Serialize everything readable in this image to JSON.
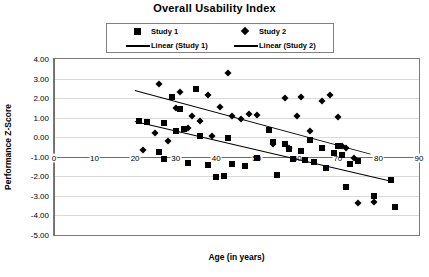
{
  "chart_data": {
    "type": "scatter",
    "title": "Overall Usability Index",
    "xlabel": "Age (in years)",
    "ylabel": "Performance Z-Score",
    "xlim": [
      0,
      90
    ],
    "ylim": [
      -5.0,
      4.0
    ],
    "xticks": [
      "0",
      "10",
      "20",
      "30",
      "40",
      "50",
      "60",
      "70",
      "80",
      "90"
    ],
    "xtick_values": [
      0,
      10,
      20,
      30,
      40,
      50,
      60,
      70,
      80,
      90
    ],
    "yticks": [
      "4.00",
      "3.00",
      "2.00",
      "1.00",
      "0.00",
      "-1.00",
      "-2.00",
      "-3.00",
      "-4.00",
      "-5.00"
    ],
    "ytick_values": [
      4,
      3,
      2,
      1,
      0,
      -1,
      -2,
      -3,
      -4,
      -5
    ],
    "grid": true,
    "x_axis_at_y": -1.0,
    "legend_position": "top-center",
    "series": [
      {
        "name": "Study 1",
        "marker": "square",
        "color": "#000000",
        "points": [
          [
            21,
            0.85
          ],
          [
            23,
            0.8
          ],
          [
            26,
            -0.75
          ],
          [
            27,
            0.75
          ],
          [
            27,
            -1.1
          ],
          [
            29,
            2.05
          ],
          [
            30,
            0.3
          ],
          [
            31,
            1.45
          ],
          [
            32,
            0.4
          ],
          [
            33,
            -1.3
          ],
          [
            35,
            2.45
          ],
          [
            36,
            0.05
          ],
          [
            38,
            -1.4
          ],
          [
            40,
            -2.05
          ],
          [
            42,
            -2.0
          ],
          [
            43,
            -0.05
          ],
          [
            44,
            -1.35
          ],
          [
            47,
            -1.45
          ],
          [
            50,
            -1.05
          ],
          [
            53,
            0.35
          ],
          [
            54,
            -0.25
          ],
          [
            55,
            -1.95
          ],
          [
            57,
            -0.35
          ],
          [
            58,
            -0.6
          ],
          [
            59,
            -1.1
          ],
          [
            61,
            -0.7
          ],
          [
            62,
            -1.15
          ],
          [
            63,
            -0.15
          ],
          [
            64,
            -1.25
          ],
          [
            66,
            -0.55
          ],
          [
            67,
            -1.55
          ],
          [
            69,
            -0.8
          ],
          [
            70,
            -0.45
          ],
          [
            71,
            -0.9
          ],
          [
            72,
            -2.55
          ],
          [
            73,
            -1.35
          ],
          [
            75,
            -1.2
          ],
          [
            79,
            -3.0
          ],
          [
            83,
            -2.2
          ],
          [
            84,
            -3.55
          ]
        ]
      },
      {
        "name": "Study 2",
        "marker": "diamond",
        "color": "#000000",
        "points": [
          [
            22,
            -0.65
          ],
          [
            25,
            0.2
          ],
          [
            26,
            2.7
          ],
          [
            28,
            -0.2
          ],
          [
            30,
            1.5
          ],
          [
            31,
            2.3
          ],
          [
            33,
            0.45
          ],
          [
            34,
            1.1
          ],
          [
            36,
            0.85
          ],
          [
            38,
            2.15
          ],
          [
            39,
            0.05
          ],
          [
            41,
            1.55
          ],
          [
            43,
            3.3
          ],
          [
            44,
            1.1
          ],
          [
            46,
            0.95
          ],
          [
            48,
            1.2
          ],
          [
            50,
            1.15
          ],
          [
            54,
            -0.35
          ],
          [
            57,
            2.0
          ],
          [
            58,
            -0.55
          ],
          [
            60,
            1.1
          ],
          [
            61,
            2.05
          ],
          [
            63,
            0.3
          ],
          [
            66,
            1.85
          ],
          [
            68,
            2.15
          ],
          [
            70,
            1.05
          ],
          [
            71,
            -0.45
          ],
          [
            72,
            -0.55
          ],
          [
            74,
            -1.05
          ],
          [
            75,
            -3.35
          ],
          [
            79,
            -3.3
          ]
        ]
      }
    ],
    "trendlines": [
      {
        "name": "Linear (Study 1)",
        "x0": 20,
        "y0": 0.85,
        "x1": 83,
        "y1": -2.2
      },
      {
        "name": "Linear (Study 2)",
        "x0": 20,
        "y0": 2.4,
        "x1": 78,
        "y1": -0.85
      }
    ]
  },
  "legend": {
    "items": [
      {
        "label": "Study 1",
        "key": "square-marker"
      },
      {
        "label": "Study 2",
        "key": "diamond-marker"
      },
      {
        "label": "Linear (Study 1)",
        "key": "line-swatch"
      },
      {
        "label": "Linear (Study 2)",
        "key": "line-swatch"
      }
    ]
  }
}
